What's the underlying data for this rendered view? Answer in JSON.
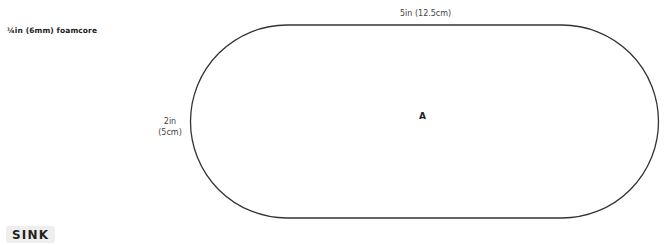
{
  "material_label": "¼in (6mm) foamcore",
  "dimensions": {
    "width_label": "5in (12.5cm)",
    "height_label_line1": "2in",
    "height_label_line2": "(5cm)"
  },
  "piece": {
    "label": "A",
    "shape": "stadium",
    "stroke_color": "#333333"
  },
  "section_badge": "SINK"
}
